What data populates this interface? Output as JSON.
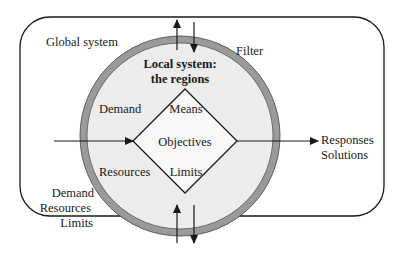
{
  "diagram": {
    "outer_box": {
      "label": "Global system"
    },
    "filter_ring": {
      "label": "Filter"
    },
    "local_system": {
      "title_line1": "Local system:",
      "title_line2": "the regions"
    },
    "diamond": {
      "top": "Means",
      "center": "Objectives",
      "bottom": "Limits"
    },
    "inner_labels": {
      "left_top": "Demand",
      "left_bottom": "Resources"
    },
    "inputs": {
      "line1": "Demand",
      "line2": "Resources",
      "line3": "Limits"
    },
    "outputs": {
      "line1": "Responses",
      "line2": "Solutions"
    },
    "colors": {
      "ring": "#9a9a9a",
      "inner_fill": "#ececec",
      "line": "#1a1a1a",
      "background": "#ffffff"
    }
  }
}
